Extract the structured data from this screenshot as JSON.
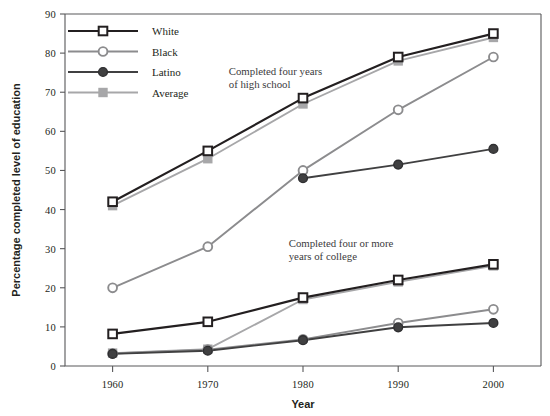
{
  "chart_data": {
    "type": "line",
    "title": "",
    "xlabel": "Year",
    "ylabel": "Percentage completed level of education",
    "x": [
      1960,
      1970,
      1980,
      1990,
      2000
    ],
    "xtick_labels": [
      "1960",
      "1970",
      "1980",
      "1990",
      "2000"
    ],
    "ytick_labels": [
      "0",
      "10",
      "20",
      "30",
      "40",
      "50",
      "60",
      "70",
      "80",
      "90"
    ],
    "yticks": [
      0,
      10,
      20,
      30,
      40,
      50,
      60,
      70,
      80,
      90
    ],
    "ylim": [
      0,
      90
    ],
    "xlim": [
      1955,
      2005
    ],
    "grid": false,
    "legend_position": "top-left",
    "annotations": [
      {
        "text_line1": "Completed four years",
        "text_line2": "of high school",
        "x": 1972.2,
        "y": 74.5
      },
      {
        "text_line1": "Completed four or more",
        "text_line2": "years of college",
        "x": 1978.5,
        "y": 30.5
      }
    ],
    "groups": [
      {
        "name": "Completed four years of high school",
        "series": [
          {
            "name": "White",
            "marker": "open-square",
            "color": "#231f20",
            "values": [
              42.0,
              55.0,
              68.5,
              79.0,
              85.0
            ]
          },
          {
            "name": "Black",
            "marker": "open-circle",
            "color": "#8c8c8e",
            "values": [
              20.0,
              30.5,
              50.0,
              65.5,
              79.0
            ]
          },
          {
            "name": "Latino",
            "marker": "filled-circle",
            "color": "#404041",
            "values": [
              null,
              null,
              48.0,
              51.5,
              55.5
            ]
          },
          {
            "name": "Average",
            "marker": "filled-square",
            "color": "#a7a7a9",
            "values": [
              41.0,
              53.0,
              67.0,
              78.0,
              84.0
            ]
          }
        ]
      },
      {
        "name": "Completed four or more years of college",
        "series": [
          {
            "name": "White",
            "marker": "open-square",
            "color": "#231f20",
            "values": [
              8.2,
              11.3,
              17.5,
              22.0,
              26.0
            ]
          },
          {
            "name": "Black",
            "marker": "open-circle",
            "color": "#8c8c8e",
            "values": [
              3.2,
              4.2,
              6.8,
              11.0,
              14.5
            ]
          },
          {
            "name": "Latino",
            "marker": "filled-circle",
            "color": "#404041",
            "values": [
              3.1,
              3.9,
              6.6,
              9.9,
              11.0
            ]
          },
          {
            "name": "Average",
            "marker": "filled-square",
            "color": "#a7a7a9",
            "values": [
              3.3,
              4.3,
              17.0,
              21.5,
              25.6
            ]
          }
        ]
      }
    ],
    "legend": [
      {
        "label": "White",
        "marker": "open-square",
        "color": "#231f20"
      },
      {
        "label": "Black",
        "marker": "open-circle",
        "color": "#8c8c8e"
      },
      {
        "label": "Latino",
        "marker": "filled-circle",
        "color": "#404041"
      },
      {
        "label": "Average",
        "marker": "filled-square",
        "color": "#a7a7a9"
      }
    ]
  }
}
